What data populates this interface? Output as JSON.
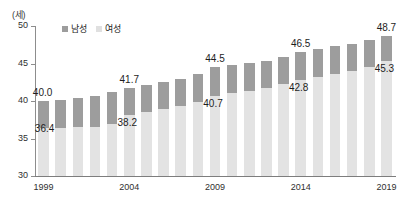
{
  "chart_data": {
    "type": "bar",
    "subtype": "stacked-column",
    "title": "",
    "xlabel": "",
    "ylabel": "(세)",
    "ylim": [
      30,
      50
    ],
    "yticks": [
      30,
      35,
      40,
      45,
      50
    ],
    "grid": false,
    "legend_position": "top-left-inside",
    "x": [
      1999,
      2000,
      2001,
      2002,
      2003,
      2004,
      2005,
      2006,
      2007,
      2008,
      2009,
      2010,
      2011,
      2012,
      2013,
      2014,
      2015,
      2016,
      2017,
      2018,
      2019
    ],
    "tick_labels": [
      "1999",
      "2004",
      "2009",
      "2014",
      "2019"
    ],
    "series": [
      {
        "name": "남성",
        "color": "#9d9d9d",
        "values": [
          40.0,
          40.1,
          40.4,
          40.7,
          41.2,
          41.7,
          42.1,
          42.5,
          43.0,
          43.6,
          44.5,
          44.8,
          45.1,
          45.4,
          45.9,
          46.5,
          46.9,
          47.3,
          47.6,
          48.1,
          48.7
        ]
      },
      {
        "name": "여성",
        "color": "#e3e3e3",
        "values": [
          36.4,
          36.4,
          36.5,
          36.6,
          37.0,
          38.2,
          38.6,
          38.9,
          39.3,
          39.9,
          40.7,
          41.1,
          41.4,
          41.8,
          42.3,
          42.8,
          43.2,
          43.6,
          44.0,
          44.6,
          45.3
        ]
      }
    ],
    "data_labels": [
      {
        "series": "남성",
        "x": 1999,
        "value": 40.0,
        "text": "40.0",
        "position": "above-left"
      },
      {
        "series": "여성",
        "x": 1999,
        "value": 36.4,
        "text": "36.4",
        "position": "at-top-left"
      },
      {
        "series": "남성",
        "x": 2004,
        "value": 41.7,
        "text": "41.7",
        "position": "above"
      },
      {
        "series": "여성",
        "x": 2004,
        "value": 38.2,
        "text": "38.2",
        "position": "below-top"
      },
      {
        "series": "남성",
        "x": 2009,
        "value": 44.5,
        "text": "44.5",
        "position": "above"
      },
      {
        "series": "여성",
        "x": 2009,
        "value": 40.7,
        "text": "40.7",
        "position": "below-top"
      },
      {
        "series": "남성",
        "x": 2014,
        "value": 46.5,
        "text": "46.5",
        "position": "above"
      },
      {
        "series": "여성",
        "x": 2014,
        "value": 42.8,
        "text": "42.8",
        "position": "below-top"
      },
      {
        "series": "남성",
        "x": 2019,
        "value": 48.7,
        "text": "48.7",
        "position": "above"
      },
      {
        "series": "여성",
        "x": 2019,
        "value": 45.3,
        "text": "45.3",
        "position": "below-top"
      }
    ]
  },
  "axis": {
    "unit_caption": "(세)",
    "y_tick_labels": [
      "50",
      "45",
      "40",
      "35",
      "30"
    ],
    "x_tick_labels": [
      "1999",
      "2004",
      "2009",
      "2014",
      "2019"
    ]
  },
  "legend": {
    "items": [
      {
        "label": "남성",
        "color": "#9d9d9d"
      },
      {
        "label": "여성",
        "color": "#e0e0e0"
      }
    ]
  },
  "colors": {
    "male": "#9d9d9d",
    "female": "#e3e3e3",
    "axis": "#8d8d8d",
    "text": "#2f2f2f",
    "background": "#ffffff"
  }
}
